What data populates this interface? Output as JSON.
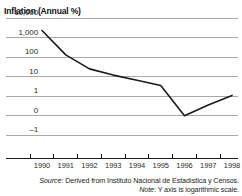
{
  "chart_data": {
    "type": "line",
    "title": "Inflation (Annual %)",
    "xlabel": "",
    "ylabel": "Inflation (Annual %)",
    "yscale": "log",
    "grid": true,
    "legend": "none",
    "line_color": "#1a1a1a",
    "grid_color": "#a9a9a9",
    "axis_color": "#1a1a1a",
    "categories": [
      "1990",
      "1991",
      "1992",
      "1993",
      "1994",
      "1995",
      "1996",
      "1997",
      "1998"
    ],
    "ytick_labels": [
      "10,000",
      "1,000",
      "100",
      "10",
      "1",
      "0",
      "-1"
    ],
    "ytick_values": [
      10000,
      1000,
      100,
      10,
      1,
      0,
      -1
    ],
    "series": [
      {
        "name": "Inflation (Annual %)",
        "values": [
          2300,
          130,
          25,
          12,
          6.5,
          3.5,
          0.0,
          0.55,
          1.1
        ]
      }
    ],
    "annotations": []
  },
  "footnotes": {
    "source_lead": "Source",
    "source_text": ": Derived from Instituto Nacional de Estadística y Censos.",
    "note_lead": "Note",
    "note_text": ": Y axis is logarithmic scale."
  }
}
